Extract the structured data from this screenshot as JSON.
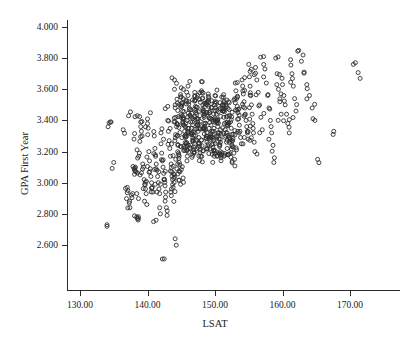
{
  "figure": {
    "top_remnant_text": "···",
    "background_color": "#ffffff",
    "marker_color": "#2f2f2f",
    "axis_color": "#2b2b2b"
  },
  "chart_data": {
    "type": "scatter",
    "title": "",
    "subtitle": "",
    "xlabel": "LSAT",
    "ylabel": "GPA First Year",
    "grid": false,
    "legend": false,
    "xlim": [
      126.5,
      174.5
    ],
    "ylim": [
      2.49,
      4.06
    ],
    "xticks": [
      130,
      140,
      150,
      160,
      170
    ],
    "xtick_labels": [
      "130.00",
      "140.00",
      "150.00",
      "160.00",
      "170.00"
    ],
    "yticks": [
      2.6,
      2.8,
      3.0,
      3.2,
      3.4,
      3.6,
      3.8,
      4.0
    ],
    "ytick_labels": [
      "2.600",
      "2.800",
      "3.000",
      "3.200",
      "3.400",
      "3.600",
      "3.800",
      "4.000"
    ],
    "marker": "open-circle",
    "marker_size_px": 4,
    "n_points": 760,
    "x": [
      134.0,
      135.0,
      134.6,
      136.4,
      137.2,
      137.0,
      137.1,
      137.3,
      137.4,
      137.6,
      137.8,
      138.0,
      138.0,
      138.1,
      138.2,
      138.3,
      138.4,
      138.4,
      138.5,
      138.6,
      138.7,
      138.8,
      138.9,
      139.0,
      139.0,
      139.1,
      139.2,
      139.3,
      139.4,
      139.5,
      139.6,
      139.7,
      139.8,
      139.9,
      140.0,
      140.0,
      140.1,
      140.2,
      140.3,
      140.4,
      140.5,
      140.6,
      140.7,
      140.8,
      140.9,
      141.0,
      141.1,
      141.2,
      141.3,
      141.4,
      141.5,
      141.6,
      141.7,
      141.8,
      141.9,
      142.0,
      142.0,
      142.1,
      142.2,
      142.3,
      142.4,
      142.5,
      142.6,
      142.7,
      142.8,
      142.9,
      143.0,
      143.0,
      143.1,
      143.2,
      143.3,
      143.4,
      143.5,
      143.6,
      143.7,
      143.8,
      143.9,
      144.0,
      144.0,
      144.1,
      144.2,
      144.3,
      144.4,
      144.5,
      144.6,
      144.7,
      144.8,
      144.9,
      145.0,
      145.0,
      145.1,
      145.2,
      145.3,
      145.4,
      145.5,
      145.6,
      145.7,
      145.8,
      145.9,
      146.0,
      146.0,
      146.1,
      146.2,
      146.3,
      146.4,
      146.5,
      146.6,
      146.7,
      146.8,
      146.9,
      147.0,
      147.0,
      147.1,
      147.2,
      147.3,
      147.4,
      147.5,
      147.6,
      147.7,
      147.8,
      147.9,
      148.0,
      148.0,
      148.1,
      148.2,
      148.3,
      148.4,
      148.5,
      148.6,
      148.7,
      148.8,
      148.9,
      149.0,
      149.0,
      149.1,
      149.2,
      149.3,
      149.4,
      149.5,
      149.6,
      149.7,
      149.8,
      149.9,
      150.0,
      150.0,
      150.1,
      150.2,
      150.3,
      150.4,
      150.5,
      150.6,
      150.7,
      150.8,
      150.9,
      151.0,
      151.1,
      151.2,
      151.3,
      151.4,
      151.5,
      151.6,
      151.7,
      151.8,
      151.9,
      152.0,
      152.1,
      152.2,
      152.3,
      152.4,
      152.5,
      152.6,
      152.7,
      152.8,
      152.9,
      153.0,
      153.1,
      153.2,
      153.3,
      153.4,
      153.5,
      153.6,
      153.7,
      153.8,
      153.9,
      154.0,
      154.1,
      154.2,
      154.3,
      154.4,
      154.5,
      154.6,
      154.7,
      154.8,
      154.9,
      155.0,
      155.1,
      155.2,
      155.3,
      155.4,
      155.5,
      155.6,
      155.7,
      155.8,
      155.9,
      156.0,
      156.2,
      156.4,
      156.6,
      156.8,
      157.0,
      157.2,
      157.4,
      157.6,
      157.8,
      158.0,
      158.2,
      158.4,
      158.6,
      158.8,
      159.0,
      159.2,
      159.4,
      159.6,
      159.8,
      160.0,
      160.2,
      160.4,
      160.6,
      160.8,
      161.0,
      161.2,
      161.4,
      161.6,
      161.8,
      162.0,
      162.4,
      162.8,
      163.2,
      163.6,
      164.0,
      164.4,
      164.8,
      165.2,
      167.5,
      170.5,
      171.5,
      142.2,
      144.1,
      134.5,
      138.5
    ],
    "y": [
      2.73,
      3.13,
      3.39,
      3.34,
      3.43,
      2.97,
      2.95,
      2.87,
      2.84,
      2.92,
      2.93,
      3.28,
      3.09,
      3.08,
      3.1,
      3.07,
      2.93,
      2.78,
      2.77,
      2.76,
      3.17,
      3.19,
      3.05,
      3.39,
      3.36,
      3.33,
      3.3,
      3.12,
      3.1,
      3.02,
      2.99,
      2.96,
      2.93,
      2.86,
      3.41,
      3.38,
      3.35,
      3.2,
      3.14,
      3.09,
      3.04,
      3.0,
      2.97,
      2.94,
      2.75,
      3.3,
      3.22,
      3.17,
      3.12,
      3.08,
      3.04,
      3.0,
      2.96,
      2.93,
      2.8,
      3.32,
      3.25,
      3.19,
      3.14,
      3.1,
      3.06,
      3.02,
      2.98,
      2.94,
      2.84,
      2.79,
      3.49,
      3.4,
      3.33,
      3.27,
      3.22,
      3.17,
      3.12,
      3.07,
      3.02,
      2.97,
      2.88,
      3.66,
      3.6,
      3.5,
      3.42,
      3.36,
      3.3,
      3.24,
      3.19,
      3.13,
      3.07,
      2.99,
      3.61,
      3.55,
      3.5,
      3.46,
      3.41,
      3.37,
      3.33,
      3.29,
      3.25,
      3.21,
      3.17,
      3.62,
      3.56,
      3.52,
      3.47,
      3.43,
      3.39,
      3.35,
      3.31,
      3.27,
      3.23,
      3.19,
      3.58,
      3.53,
      3.49,
      3.45,
      3.41,
      3.37,
      3.33,
      3.29,
      3.25,
      3.21,
      3.17,
      3.65,
      3.59,
      3.54,
      3.5,
      3.46,
      3.42,
      3.38,
      3.34,
      3.3,
      3.26,
      3.22,
      3.57,
      3.53,
      3.49,
      3.45,
      3.41,
      3.37,
      3.33,
      3.29,
      3.25,
      3.21,
      3.17,
      3.56,
      3.52,
      3.48,
      3.44,
      3.4,
      3.36,
      3.32,
      3.28,
      3.24,
      3.2,
      3.16,
      3.55,
      3.5,
      3.46,
      3.42,
      3.38,
      3.34,
      3.3,
      3.26,
      3.22,
      3.18,
      3.52,
      3.47,
      3.43,
      3.39,
      3.35,
      3.31,
      3.27,
      3.23,
      3.19,
      3.15,
      3.64,
      3.59,
      3.54,
      3.49,
      3.45,
      3.41,
      3.37,
      3.33,
      3.29,
      3.25,
      3.66,
      3.62,
      3.57,
      3.52,
      3.48,
      3.44,
      3.4,
      3.36,
      3.32,
      3.28,
      3.76,
      3.68,
      3.62,
      3.56,
      3.5,
      3.44,
      3.38,
      3.32,
      3.26,
      3.2,
      3.74,
      3.66,
      3.58,
      3.5,
      3.42,
      3.34,
      3.81,
      3.73,
      3.64,
      3.56,
      3.48,
      3.4,
      3.32,
      3.24,
      3.16,
      3.8,
      3.7,
      3.6,
      3.52,
      3.44,
      3.63,
      3.56,
      3.5,
      3.44,
      3.38,
      3.32,
      3.79,
      3.7,
      3.62,
      3.54,
      3.46,
      3.85,
      3.78,
      3.71,
      3.63,
      3.56,
      3.48,
      3.4,
      3.15,
      3.31,
      3.76,
      3.67,
      2.51,
      2.64,
      3.39,
      3.43
    ]
  }
}
